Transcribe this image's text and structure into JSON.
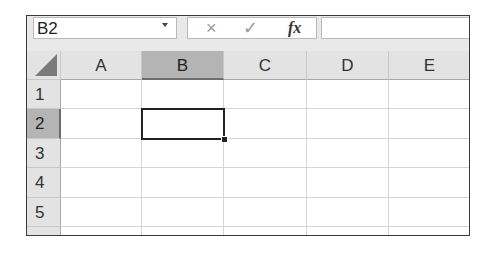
{
  "formula_bar": {
    "name_box": "B2",
    "name_box_dropdown": "chevron-down-icon",
    "cancel_icon": "×",
    "enter_icon": "✓",
    "function_icon": "fx",
    "formula_value": ""
  },
  "sheet": {
    "columns": [
      "A",
      "B",
      "C",
      "D",
      "E"
    ],
    "rows": [
      "1",
      "2",
      "3",
      "4",
      "5",
      "6"
    ],
    "selected_cell": "B2",
    "selected_column": "B",
    "selected_row": "2"
  },
  "colors": {
    "header_bg": "#e3e3e3",
    "header_selected_bg": "#b4b4b4",
    "gridline": "#d4d4d4",
    "active_border": "#222222"
  }
}
